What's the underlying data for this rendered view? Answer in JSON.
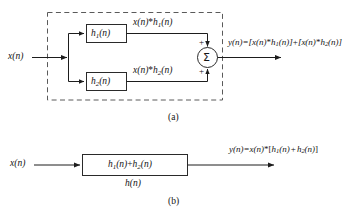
{
  "figure": {
    "stroke_color": "#222222",
    "dashed_color": "#555555",
    "background": "#ffffff"
  },
  "panel_a": {
    "caption": "(a)",
    "input_label": {
      "base": "x",
      "arg": "(n)"
    },
    "block_top": {
      "base": "h",
      "sub": "1",
      "arg": "(n)"
    },
    "block_bottom": {
      "base": "h",
      "sub": "2",
      "arg": "(n)"
    },
    "branch_top_label": {
      "lhs": "x(n)",
      "op": "*",
      "rhs_base": "h",
      "rhs_sub": "1",
      "rhs_arg": "(n)"
    },
    "branch_bottom_label": {
      "lhs": "x(n)",
      "op": "*",
      "rhs_base": "h",
      "rhs_sub": "2",
      "rhs_arg": "(n)"
    },
    "summer": {
      "symbol": "Σ",
      "sign_top": "+",
      "sign_bottom": "+"
    },
    "output_equation": {
      "lhs": "y(n)=",
      "term1_open": "[x(n)",
      "term1_op": "*",
      "term1_h_base": "h",
      "term1_h_sub": "1",
      "term1_close": "(n)]",
      "join": "+",
      "term2_open": "[x(n)",
      "term2_op": "*",
      "term2_h_base": "h",
      "term2_h_sub": "2",
      "term2_close": "(n)]"
    },
    "dashed_boundary": "system-enclosure"
  },
  "panel_b": {
    "caption": "(b)",
    "input_label": {
      "base": "x",
      "arg": "(n)"
    },
    "block_text": {
      "h1_base": "h",
      "h1_sub": "1",
      "h1_arg": "(n)",
      "plus": "+",
      "h2_base": "h",
      "h2_sub": "2",
      "h2_arg": "(n)"
    },
    "block_under_label": {
      "base": "h",
      "arg": "(n)"
    },
    "output_equation": {
      "lhs": "y(n)=x(n)",
      "op": "*",
      "open": "[",
      "h1_base": "h",
      "h1_sub": "1",
      "h1_arg": "(n)",
      "plus": "+",
      "h2_base": "h",
      "h2_sub": "2",
      "h2_arg": "(n)",
      "close": "]"
    }
  }
}
